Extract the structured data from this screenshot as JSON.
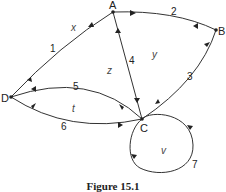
{
  "diagram": {
    "type": "directed graph",
    "nodes": [
      {
        "id": "A",
        "label": "A"
      },
      {
        "id": "B",
        "label": "B"
      },
      {
        "id": "C",
        "label": "C"
      },
      {
        "id": "D",
        "label": "D"
      }
    ],
    "edges": [
      {
        "label": "1",
        "from": "D",
        "to": "A",
        "bidirectional": true
      },
      {
        "label": "2",
        "from": "A",
        "to": "B",
        "bidirectional": true
      },
      {
        "label": "3",
        "from": "B",
        "to": "C",
        "bidirectional": true
      },
      {
        "label": "4",
        "from": "A",
        "to": "C",
        "bidirectional": true
      },
      {
        "label": "5",
        "from": "C",
        "to": "D",
        "bidirectional": true
      },
      {
        "label": "6",
        "from": "D",
        "to": "C",
        "bidirectional": true
      },
      {
        "label": "7",
        "from": "C",
        "to": "C",
        "loop": true
      }
    ],
    "faces": [
      "x",
      "y",
      "z",
      "t",
      "v"
    ],
    "caption": "Figure 15.1"
  }
}
